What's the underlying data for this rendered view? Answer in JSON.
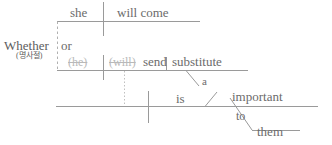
{
  "diagram": {
    "type": "reed-kellogg-sentence-diagram",
    "ink_color": "#6b6b6b",
    "faint_ink_color": "#b9b9b9",
    "line_color": "#9a9a9a",
    "dashed_line_color": "#b0b0b0",
    "background": "#ffffff",
    "clause_top": {
      "subject": "she",
      "predicate": "will  come"
    },
    "conjunction": {
      "subordinator": "Whether",
      "subordinator_note": "(명사절)",
      "coordinator": "or"
    },
    "clause_middle": {
      "subject": "(he)",
      "subject_struck": true,
      "auxiliary": "(will)",
      "auxiliary_struck": true,
      "verb": "send",
      "object": "substitute",
      "object_article": "a"
    },
    "clause_main": {
      "verb": "is",
      "complement": "important",
      "prep": "to",
      "prep_object": "them"
    }
  }
}
